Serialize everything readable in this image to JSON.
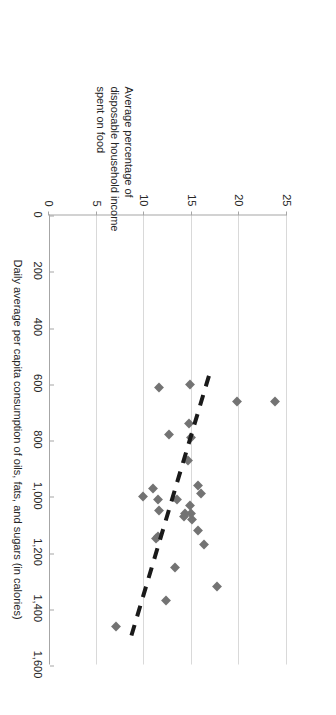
{
  "chart_data": {
    "type": "scatter",
    "title": "",
    "xlabel": "Daily average per capita consumption of oils, fats, and sugars (in calories)",
    "ylabel": "Average percentage of disposable household income spent on food",
    "xlim": [
      0,
      1600
    ],
    "ylim": [
      0,
      25
    ],
    "xticks": [
      "0",
      "200",
      "400",
      "600",
      "800",
      "1,000",
      "1,200",
      "1,400",
      "1,600"
    ],
    "xtick_values": [
      0,
      200,
      400,
      600,
      800,
      1000,
      1200,
      1400,
      1600
    ],
    "yticks": [
      "0",
      "5",
      "10",
      "15",
      "20",
      "25"
    ],
    "ytick_values": [
      0,
      5,
      10,
      15,
      20,
      25
    ],
    "grid": "vertical-gridlines-at-y-ticks",
    "legend": "none",
    "marker_shape": "diamond",
    "marker_color": "#737373",
    "trendline": {
      "style": "dashed",
      "color": "#1a1a1a",
      "x_start": 570,
      "y_start": 16.8,
      "x_end": 1500,
      "y_end": 8.6
    },
    "points": [
      {
        "x": 660,
        "y": 23.7
      },
      {
        "x": 660,
        "y": 19.7
      },
      {
        "x": 1320,
        "y": 17.6
      },
      {
        "x": 1170,
        "y": 16.3
      },
      {
        "x": 1120,
        "y": 15.6
      },
      {
        "x": 1080,
        "y": 15.0
      },
      {
        "x": 990,
        "y": 16.0
      },
      {
        "x": 960,
        "y": 15.6
      },
      {
        "x": 1030,
        "y": 14.8
      },
      {
        "x": 1060,
        "y": 14.9
      },
      {
        "x": 1060,
        "y": 14.3
      },
      {
        "x": 1070,
        "y": 14.2
      },
      {
        "x": 1010,
        "y": 13.4
      },
      {
        "x": 870,
        "y": 14.6
      },
      {
        "x": 790,
        "y": 14.9
      },
      {
        "x": 740,
        "y": 14.7
      },
      {
        "x": 600,
        "y": 14.8
      },
      {
        "x": 780,
        "y": 12.6
      },
      {
        "x": 610,
        "y": 11.6
      },
      {
        "x": 1250,
        "y": 13.2
      },
      {
        "x": 1370,
        "y": 12.3
      },
      {
        "x": 1140,
        "y": 11.4
      },
      {
        "x": 1150,
        "y": 11.2
      },
      {
        "x": 1050,
        "y": 11.6
      },
      {
        "x": 1010,
        "y": 11.4
      },
      {
        "x": 970,
        "y": 10.9
      },
      {
        "x": 1000,
        "y": 9.9
      },
      {
        "x": 1460,
        "y": 7.0
      }
    ]
  }
}
